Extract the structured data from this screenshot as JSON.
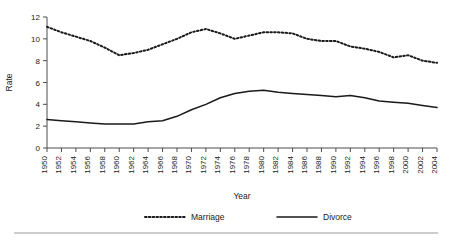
{
  "chart_data": {
    "type": "line",
    "title": "",
    "xlabel": "Year",
    "ylabel": "Rate",
    "xlim": [
      1950,
      2004
    ],
    "ylim": [
      0,
      12
    ],
    "yticks": [
      0,
      2,
      4,
      6,
      8,
      10,
      12
    ],
    "grid": false,
    "legend_position": "bottom",
    "categories": [
      1950,
      1952,
      1954,
      1956,
      1958,
      1960,
      1962,
      1964,
      1966,
      1968,
      1970,
      1972,
      1974,
      1976,
      1978,
      1980,
      1982,
      1984,
      1986,
      1988,
      1990,
      1992,
      1994,
      1996,
      1998,
      2000,
      2002,
      2004
    ],
    "xtick_labels": [
      "1950",
      "1952",
      "1954",
      "1956",
      "1958",
      "1960",
      "1962",
      "1964",
      "1966",
      "1968",
      "1970",
      "1972",
      "1974",
      "1976",
      "1978",
      "1980",
      "1982",
      "1984",
      "1986",
      "1988",
      "1990",
      "1992",
      "1994",
      "1996",
      "1998",
      "2000",
      "2002",
      "2004"
    ],
    "series": [
      {
        "name": "Marriage",
        "style": "dotted",
        "color": "#1a1a1a",
        "values": [
          11.1,
          10.6,
          10.2,
          9.8,
          9.2,
          8.5,
          8.7,
          9.0,
          9.5,
          10.0,
          10.6,
          10.9,
          10.5,
          10.0,
          10.3,
          10.6,
          10.6,
          10.5,
          10.0,
          9.8,
          9.8,
          9.3,
          9.1,
          8.8,
          8.3,
          8.5,
          8.0,
          7.8
        ]
      },
      {
        "name": "Divorce",
        "style": "solid",
        "color": "#1a1a1a",
        "values": [
          2.6,
          2.5,
          2.4,
          2.3,
          2.2,
          2.2,
          2.2,
          2.4,
          2.5,
          2.9,
          3.5,
          4.0,
          4.6,
          5.0,
          5.2,
          5.3,
          5.1,
          5.0,
          4.9,
          4.8,
          4.7,
          4.8,
          4.6,
          4.3,
          4.2,
          4.1,
          3.9,
          3.7
        ]
      }
    ]
  },
  "axis": {
    "y_label": "Rate",
    "x_label": "Year"
  },
  "legend": {
    "items": [
      {
        "label": "Marriage",
        "style": "dotted"
      },
      {
        "label": "Divorce",
        "style": "solid"
      }
    ]
  }
}
